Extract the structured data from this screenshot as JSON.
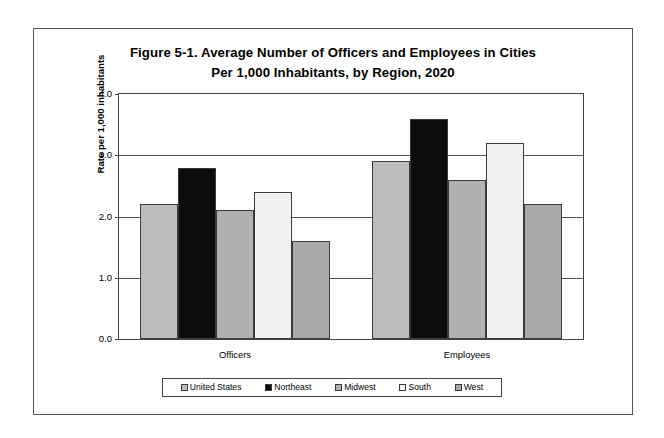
{
  "chart_data": {
    "type": "bar",
    "title": "Figure 5-1. Average Number of Officers and Employees in Cities Per 1,000 Inhabitants, by Region, 2020",
    "title_lines": [
      "Figure 5-1. Average Number of Officers and Employees in Cities",
      "Per 1,000 Inhabitants,  by Region, 2020"
    ],
    "categories": [
      "Officers",
      "Employees"
    ],
    "series": [
      {
        "name": "United States",
        "values": [
          2.2,
          2.9
        ],
        "color": "#bdbdbd"
      },
      {
        "name": "Northeast",
        "values": [
          2.8,
          3.6
        ],
        "color": "#0d0d0d"
      },
      {
        "name": "Midwest",
        "values": [
          2.1,
          2.6
        ],
        "color": "#b0b0b0"
      },
      {
        "name": "South",
        "values": [
          2.4,
          3.2
        ],
        "color": "#f0f0f0"
      },
      {
        "name": "West",
        "values": [
          1.6,
          2.2
        ],
        "color": "#a8a8a8"
      }
    ],
    "xlabel": "",
    "ylabel": "Rate per 1,000 inhabitants",
    "ylim": [
      0.0,
      4.0
    ],
    "ytick_step": 1.0,
    "yticks": [
      "0.0",
      "1.0",
      "2.0",
      "3.0",
      "4.0"
    ],
    "grid": true,
    "legend_position": "bottom"
  }
}
